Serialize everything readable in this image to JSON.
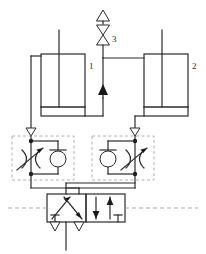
{
  "diagram": {
    "background_color": "#ffffff",
    "line_color": "#2b2b2b",
    "dashed_color": "#9a9a9a",
    "fill_color": "#1a1a1a"
  },
  "labels": {
    "cylinder_left": "1",
    "cylinder_right": "2",
    "top_valve": "3"
  },
  "components": [
    {
      "id": "cylinder-1",
      "name": "double-acting-cylinder-left",
      "label": "1",
      "type": "cylinder"
    },
    {
      "id": "cylinder-2",
      "name": "double-acting-cylinder-right",
      "label": "2",
      "type": "cylinder"
    },
    {
      "id": "valve-3",
      "name": "shuttle-exhaust-valve",
      "label": "3",
      "type": "valve"
    },
    {
      "id": "flow-control-left",
      "name": "flow-control-valve-left",
      "label": "",
      "type": "throttle-check-valve"
    },
    {
      "id": "flow-control-right",
      "name": "flow-control-valve-right",
      "label": "",
      "type": "throttle-check-valve"
    },
    {
      "id": "directional-valve",
      "name": "directional-control-valve",
      "label": "",
      "type": "4-2-way-valve"
    }
  ],
  "icons": {
    "triangle_up": "triangle-up-icon",
    "triangle_down": "triangle-down-icon",
    "check_valve": "check-valve-icon",
    "throttle": "adjustable-throttle-icon",
    "exhaust": "exhaust-port-icon",
    "arrow_up_solid": "solid-arrow-up-icon"
  }
}
